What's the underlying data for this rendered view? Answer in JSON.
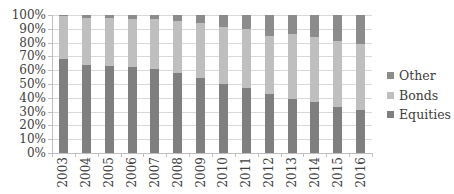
{
  "chart_data": {
    "type": "bar",
    "stacked": true,
    "percent_stacked": true,
    "title": "",
    "xlabel": "",
    "ylabel": "",
    "ylim": [
      0,
      100
    ],
    "yticks": [
      "0%",
      "10%",
      "20%",
      "30%",
      "40%",
      "50%",
      "60%",
      "70%",
      "80%",
      "90%",
      "100%"
    ],
    "grid": true,
    "legend_position": "right",
    "categories": [
      "2003",
      "2004",
      "2005",
      "2006",
      "2007",
      "2008",
      "2009",
      "2010",
      "2011",
      "2012",
      "2013",
      "2014",
      "2015",
      "2016"
    ],
    "series": [
      {
        "name": "Equities",
        "color": "#7f7f7f",
        "values": [
          68,
          64,
          63,
          62,
          61,
          58,
          54,
          50,
          47,
          43,
          39,
          37,
          33,
          31
        ]
      },
      {
        "name": "Bonds",
        "color": "#bfbfbf",
        "values": [
          31,
          34,
          35,
          35,
          36,
          38,
          40,
          41,
          43,
          42,
          47,
          47,
          48,
          48
        ]
      },
      {
        "name": "Other",
        "color": "#8c8c8c",
        "values": [
          1,
          2,
          2,
          3,
          3,
          4,
          6,
          9,
          10,
          15,
          14,
          16,
          19,
          21
        ]
      }
    ]
  },
  "legend": {
    "items": [
      {
        "label": "Other",
        "color": "#8c8c8c"
      },
      {
        "label": "Bonds",
        "color": "#bfbfbf"
      },
      {
        "label": "Equities",
        "color": "#7f7f7f"
      }
    ]
  }
}
